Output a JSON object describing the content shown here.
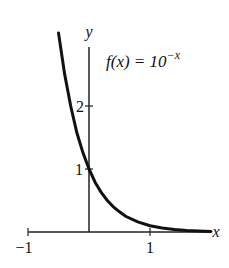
{
  "chart_data": {
    "type": "line",
    "title": "",
    "function_label": {
      "prefix": "f(x) = 10",
      "exponent": "−x"
    },
    "xlabel": "x",
    "ylabel": "y",
    "x_ticks": [
      {
        "value": -1,
        "label": "−1"
      },
      {
        "value": 1,
        "label": "1"
      }
    ],
    "y_ticks": [
      {
        "value": 1,
        "label": "1"
      },
      {
        "value": 2,
        "label": "2"
      }
    ],
    "xlim": [
      -1,
      2
    ],
    "ylim": [
      0,
      3.1
    ],
    "grid": false,
    "legend": "none",
    "series": [
      {
        "name": "f(x) = 10^(-x)",
        "x": [
          -0.5,
          -0.4,
          -0.3,
          -0.2,
          -0.1,
          0,
          0.1,
          0.2,
          0.3,
          0.4,
          0.5,
          0.6,
          0.8,
          1.0,
          1.2,
          1.4,
          1.6,
          1.8,
          2.0
        ],
        "y": [
          3.16,
          2.51,
          2.0,
          1.58,
          1.26,
          1.0,
          0.79,
          0.63,
          0.5,
          0.4,
          0.32,
          0.25,
          0.16,
          0.1,
          0.063,
          0.04,
          0.025,
          0.016,
          0.01
        ]
      }
    ]
  }
}
